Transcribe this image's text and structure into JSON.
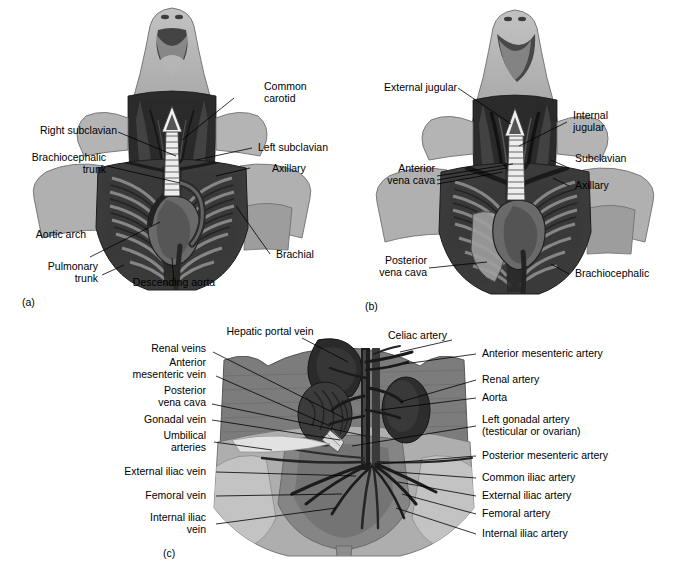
{
  "figure": {
    "panels": [
      {
        "id": "a",
        "tag": "(a)",
        "caption": "Thoracic arteries, ventral view",
        "labels_left": [
          {
            "text": "Right subclavian"
          },
          {
            "text_line1": "Brachiocephalic",
            "text_line2": "trunk"
          },
          {
            "text": "Aortic arch"
          },
          {
            "text_line1": "Pulmonary",
            "text_line2": "trunk"
          }
        ],
        "labels_right": [
          {
            "text_line1": "Common",
            "text_line2": "carotid"
          },
          {
            "text": "Left subclavian"
          },
          {
            "text": "Axillary"
          },
          {
            "text": "Brachial"
          }
        ],
        "labels_bottom": [
          {
            "text": "Descending aorta"
          }
        ]
      },
      {
        "id": "b",
        "tag": "(b)",
        "caption": "Thoracic veins, ventral view",
        "labels_left": [
          {
            "text": "External jugular"
          },
          {
            "text_line1": "Anterior",
            "text_line2": "vena cava"
          },
          {
            "text_line1": "Posterior",
            "text_line2": "vena cava"
          }
        ],
        "labels_right": [
          {
            "text_line1": "Internal",
            "text_line2": "jugular"
          },
          {
            "text": "Subclavian"
          },
          {
            "text": "Axillary"
          },
          {
            "text": "Brachiocephalic"
          }
        ]
      },
      {
        "id": "c",
        "tag": "(c)",
        "caption": "Abdominal and pelvic vessels, ventral view",
        "labels_top": [
          {
            "text": "Hepatic portal vein"
          },
          {
            "text": "Celiac artery"
          }
        ],
        "labels_left": [
          {
            "text": "Renal veins"
          },
          {
            "text_line1": "Anterior",
            "text_line2": "mesenteric vein"
          },
          {
            "text_line1": "Posterior",
            "text_line2": "vena cava"
          },
          {
            "text": "Gonadal vein"
          },
          {
            "text_line1": "Umbilical",
            "text_line2": "arteries"
          },
          {
            "text": "External iliac vein"
          },
          {
            "text": "Femoral vein"
          },
          {
            "text_line1": "Internal iliac",
            "text_line2": "vein"
          }
        ],
        "labels_right": [
          {
            "text": "Anterior mesenteric artery"
          },
          {
            "text": "Renal artery"
          },
          {
            "text": "Aorta"
          },
          {
            "text_line1": "Left gonadal artery",
            "text_line2": "(testicular or ovarian)"
          },
          {
            "text": "Posterior mesenteric artery"
          },
          {
            "text": "Common iliac artery"
          },
          {
            "text": "External iliac artery"
          },
          {
            "text": "Femoral artery"
          },
          {
            "text": "Internal iliac artery"
          }
        ]
      }
    ]
  },
  "colors": {
    "background": "#ffffff",
    "text": "#000000",
    "leader_line": "#000000",
    "skin_light": "#b9b9b9",
    "skin_mid": "#9a9a9a",
    "body_wall": "#7f7f7f",
    "body_wall_dark": "#6a6a6a",
    "cavity_dark": "#3a3a3a",
    "cavity_darker": "#262626",
    "organ_dark": "#2e2e2e",
    "vessel_dark": "#1c1c1c",
    "highlight": "#e8e8e8",
    "muscle": "#5a5a5a"
  }
}
